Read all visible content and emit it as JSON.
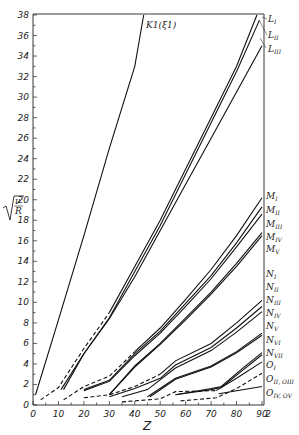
{
  "chart_data": {
    "type": "line",
    "title": "",
    "xlabel": "Z",
    "ylabel": "√(ν/R)",
    "xlim": [
      0,
      92
    ],
    "ylim": [
      0,
      38
    ],
    "grid": false,
    "x_ticks": [
      "0",
      "10",
      "20",
      "30",
      "40",
      "50",
      "60",
      "70",
      "80",
      "90"
    ],
    "x_extra_tick": "2",
    "y_ticks": [
      "0",
      "2",
      "4",
      "6",
      "8",
      "10",
      "12",
      "14",
      "16",
      "18",
      "20",
      "22",
      "24",
      "26",
      "28",
      "30",
      "32",
      "34",
      "36",
      "38"
    ],
    "series": [
      {
        "name": "K1(ξ1)",
        "style": "solid",
        "points": [
          [
            1,
            1.0
          ],
          [
            10,
            8.3
          ],
          [
            20,
            16.5
          ],
          [
            30,
            25
          ],
          [
            40,
            33
          ],
          [
            43.5,
            38
          ]
        ]
      },
      {
        "name": "L_I",
        "style": "dashed-solid",
        "points": [
          [
            3,
            0.5
          ],
          [
            10,
            1.7
          ],
          [
            20,
            5.5
          ],
          [
            30,
            9.0
          ],
          [
            40,
            13.5
          ],
          [
            50,
            18
          ],
          [
            60,
            23
          ],
          [
            70,
            28
          ],
          [
            80,
            33
          ],
          [
            88,
            38
          ]
        ]
      },
      {
        "name": "L_II",
        "style": "solid",
        "points": [
          [
            11,
            1.5
          ],
          [
            20,
            5.0
          ],
          [
            30,
            8.5
          ],
          [
            40,
            13
          ],
          [
            50,
            17.5
          ],
          [
            60,
            22.5
          ],
          [
            70,
            27.5
          ],
          [
            80,
            32.5
          ],
          [
            89,
            37.5
          ]
        ]
      },
      {
        "name": "L_III",
        "style": "solid",
        "points": [
          [
            12,
            1.5
          ],
          [
            20,
            5.0
          ],
          [
            30,
            8.4
          ],
          [
            40,
            12.5
          ],
          [
            50,
            17
          ],
          [
            60,
            21.5
          ],
          [
            70,
            26
          ],
          [
            80,
            30.5
          ],
          [
            90,
            35
          ]
        ]
      },
      {
        "name": "M_I",
        "style": "dashed-solid",
        "points": [
          [
            12,
            0.5
          ],
          [
            20,
            1.8
          ],
          [
            30,
            2.8
          ],
          [
            40,
            5.2
          ],
          [
            50,
            7.5
          ],
          [
            60,
            10.3
          ],
          [
            70,
            13.2
          ],
          [
            80,
            16.5
          ],
          [
            90,
            20.2
          ]
        ]
      },
      {
        "name": "M_II",
        "style": "solid",
        "points": [
          [
            20,
            1.5
          ],
          [
            30,
            2.4
          ],
          [
            40,
            5.0
          ],
          [
            50,
            7.2
          ],
          [
            60,
            9.9
          ],
          [
            70,
            12.6
          ],
          [
            80,
            15.8
          ],
          [
            90,
            19.3
          ]
        ]
      },
      {
        "name": "M_III",
        "style": "solid",
        "points": [
          [
            20,
            1.4
          ],
          [
            30,
            2.3
          ],
          [
            40,
            4.8
          ],
          [
            50,
            7.0
          ],
          [
            60,
            9.6
          ],
          [
            70,
            12.3
          ],
          [
            80,
            15.4
          ],
          [
            90,
            18.6
          ]
        ]
      },
      {
        "name": "M_IV",
        "style": "solid",
        "points": [
          [
            30,
            1.0
          ],
          [
            40,
            3.8
          ],
          [
            50,
            6.0
          ],
          [
            60,
            8.5
          ],
          [
            70,
            11.0
          ],
          [
            80,
            13.8
          ],
          [
            90,
            16.8
          ]
        ]
      },
      {
        "name": "M_V",
        "style": "solid",
        "points": [
          [
            30,
            1.0
          ],
          [
            40,
            3.7
          ],
          [
            50,
            5.9
          ],
          [
            60,
            8.3
          ],
          [
            70,
            10.8
          ],
          [
            80,
            13.5
          ],
          [
            90,
            16.5
          ]
        ]
      },
      {
        "name": "N_I",
        "style": "dashed-solid",
        "points": [
          [
            20,
            0.7
          ],
          [
            30,
            1.0
          ],
          [
            40,
            1.8
          ],
          [
            50,
            3.0
          ],
          [
            56,
            4.3
          ],
          [
            70,
            6.0
          ],
          [
            80,
            8.0
          ],
          [
            90,
            10.2
          ]
        ]
      },
      {
        "name": "N_II",
        "style": "solid",
        "points": [
          [
            30,
            0.8
          ],
          [
            40,
            1.6
          ],
          [
            50,
            2.6
          ],
          [
            56,
            3.9
          ],
          [
            70,
            5.6
          ],
          [
            80,
            7.5
          ],
          [
            90,
            9.6
          ]
        ]
      },
      {
        "name": "N_III",
        "style": "solid",
        "points": [
          [
            35,
            0.8
          ],
          [
            45,
            1.5
          ],
          [
            56,
            3.6
          ],
          [
            70,
            5.3
          ],
          [
            80,
            7.1
          ],
          [
            90,
            9.1
          ]
        ]
      },
      {
        "name": "N_IV",
        "style": "solid",
        "points": [
          [
            45,
            0.8
          ],
          [
            56,
            2.6
          ],
          [
            70,
            3.8
          ],
          [
            80,
            5.2
          ],
          [
            90,
            7.0
          ]
        ]
      },
      {
        "name": "N_V",
        "style": "solid",
        "points": [
          [
            46,
            0.8
          ],
          [
            56,
            2.5
          ],
          [
            70,
            3.7
          ],
          [
            80,
            5.1
          ],
          [
            90,
            6.8
          ]
        ]
      },
      {
        "name": "N_VI",
        "style": "solid",
        "points": [
          [
            56,
            1.0
          ],
          [
            70,
            1.6
          ],
          [
            74,
            1.8
          ],
          [
            82,
            3.5
          ],
          [
            90,
            5.1
          ]
        ]
      },
      {
        "name": "N_VII",
        "style": "solid",
        "points": [
          [
            56,
            1.0
          ],
          [
            70,
            1.5
          ],
          [
            74,
            1.7
          ],
          [
            82,
            3.3
          ],
          [
            90,
            4.9
          ]
        ]
      },
      {
        "name": "O_I",
        "style": "dashed-solid",
        "points": [
          [
            35,
            0.3
          ],
          [
            50,
            0.6
          ],
          [
            56,
            1.3
          ],
          [
            72,
            1.4
          ],
          [
            80,
            2.6
          ],
          [
            90,
            4.2
          ]
        ]
      },
      {
        "name": "O_II, O_III",
        "style": "dashed-solid",
        "points": [
          [
            58,
            0.4
          ],
          [
            72,
            0.7
          ],
          [
            80,
            1.6
          ],
          [
            90,
            3.1
          ]
        ]
      },
      {
        "name": "O_IV, O_V",
        "style": "solid",
        "points": [
          [
            73,
            1.1
          ],
          [
            90,
            1.8
          ]
        ]
      }
    ]
  },
  "labels": {
    "k_line": "K1(ξ1)",
    "l": [
      "L",
      "L",
      "L"
    ],
    "l_sub": [
      "I",
      "II",
      "III"
    ],
    "m": [
      "M",
      "M",
      "M",
      "M",
      "M"
    ],
    "m_sub": [
      "I",
      "II",
      "III",
      "IV",
      "V"
    ],
    "n": [
      "N",
      "N",
      "N",
      "N",
      "N",
      "N",
      "N"
    ],
    "n_sub": [
      "I",
      "II",
      "III",
      "IV",
      "V",
      "VI",
      "VII"
    ],
    "o1": "O",
    "o1_sub": "I",
    "o23": "O",
    "o23_sub": "II, O",
    "o23_sub2": "III",
    "o45": "O",
    "o45_sub": "IV, O",
    "o45_sub2": "V"
  }
}
